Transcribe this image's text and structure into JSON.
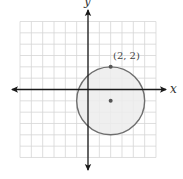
{
  "diagram": {
    "type": "coordinate-plane-circle",
    "grid": {
      "x_min": -6,
      "x_max": 6,
      "y_min": -6,
      "y_max": 6,
      "cell_px": 11.33,
      "origin_px": [
        88,
        89.5
      ],
      "grid_color": "#d6d6d6"
    },
    "axes": {
      "x_label": "x",
      "y_label": "y",
      "axis_color": "#1a1a1a"
    },
    "circle": {
      "center": [
        2,
        -1
      ],
      "radius": 3,
      "fill": "#ececec",
      "stroke": "#6e6e6e"
    },
    "points": [
      {
        "name": "center-point",
        "coords": [
          2,
          -1
        ],
        "label": ""
      },
      {
        "name": "labeled-point",
        "coords": [
          2,
          2
        ],
        "label": "(2, 2)"
      }
    ]
  }
}
